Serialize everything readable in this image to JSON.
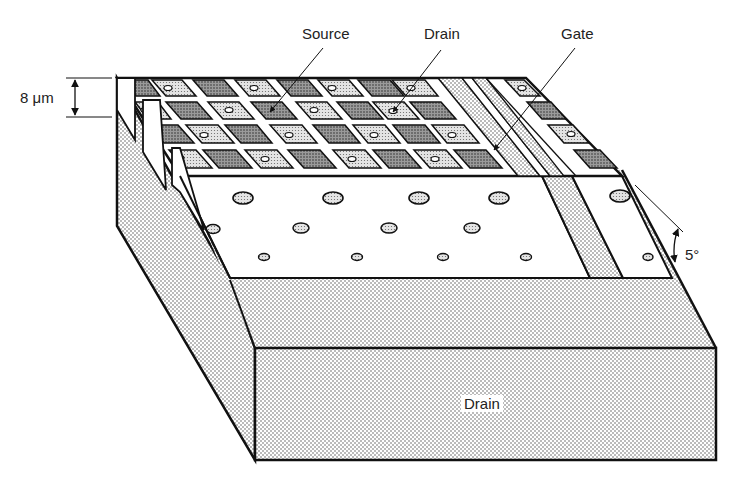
{
  "diagram": {
    "labels": {
      "source": "Source",
      "drain_top": "Drain",
      "gate": "Gate",
      "drain_bottom": "Drain",
      "thickness": "8 μm",
      "angle": "5°"
    },
    "colors": {
      "line": "#111111",
      "background": "#ffffff",
      "light_stipple": "#d9d9d9",
      "dark_stipple": "#8a8a8a"
    },
    "grid": {
      "rows": 4,
      "columns_visible": 8
    }
  }
}
